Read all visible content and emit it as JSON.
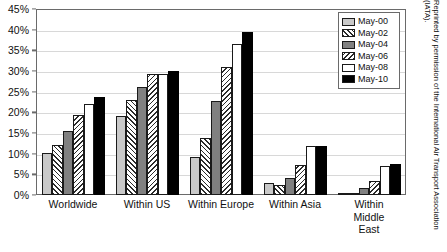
{
  "chart_data": {
    "type": "bar",
    "title": "",
    "xlabel": "",
    "ylabel": "",
    "ylim": [
      0,
      45
    ],
    "grid": true,
    "legend_position": "top-right",
    "categories": [
      "Worldwide",
      "Within US",
      "Within Europe",
      "Within Asia",
      "Within\nMiddle East"
    ],
    "ytick_labels": [
      "0%",
      "5%",
      "10%",
      "15%",
      "20%",
      "25%",
      "30%",
      "35%",
      "40%",
      "45%"
    ],
    "ytick_values": [
      0,
      5,
      10,
      15,
      20,
      25,
      30,
      35,
      40,
      45
    ],
    "series": [
      {
        "name": "May-00",
        "values": [
          10.2,
          19.0,
          9.2,
          3.0,
          0.3
        ]
      },
      {
        "name": "May-02",
        "values": [
          12.0,
          23.0,
          13.9,
          2.5,
          0.4
        ]
      },
      {
        "name": "May-04",
        "values": [
          15.5,
          26.2,
          22.7,
          4.1,
          1.7
        ]
      },
      {
        "name": "May-06",
        "values": [
          19.4,
          29.2,
          31.0,
          7.3,
          3.5
        ]
      },
      {
        "name": "May-08",
        "values": [
          22.0,
          29.3,
          36.5,
          11.8,
          7.0
        ]
      },
      {
        "name": "May-10",
        "values": [
          23.8,
          30.1,
          39.5,
          11.8,
          7.5
        ]
      }
    ]
  },
  "legend": {
    "entries": [
      {
        "label": "May-00",
        "swatch": "solid-light-gray"
      },
      {
        "label": "May-02",
        "swatch": "diagonal-hatch-right"
      },
      {
        "label": "May-04",
        "swatch": "solid-medium-gray"
      },
      {
        "label": "May-06",
        "swatch": "diagonal-hatch-left"
      },
      {
        "label": "May-08",
        "swatch": "solid-white"
      },
      {
        "label": "May-10",
        "swatch": "solid-black"
      }
    ]
  },
  "credit": {
    "text": "Reprinted by permission of the International Air Transport Association (IATA)."
  }
}
